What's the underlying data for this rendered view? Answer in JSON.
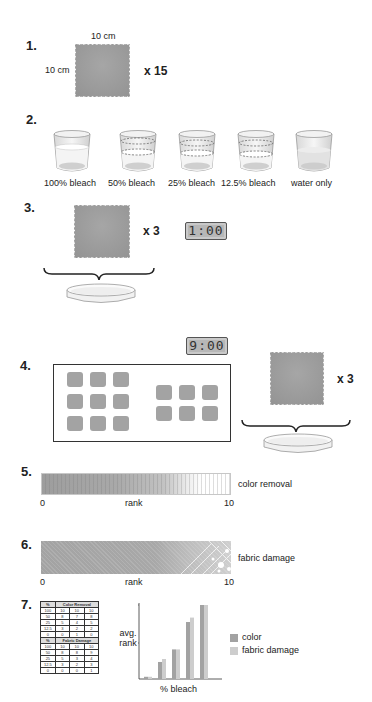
{
  "steps": {
    "s1": {
      "number": "1.",
      "width_label": "10 cm",
      "height_label": "10 cm",
      "multiplier": "x 15"
    },
    "s2": {
      "number": "2.",
      "cups": [
        {
          "label": "100% bleach",
          "fill": "full-bleach"
        },
        {
          "label": "50% bleach",
          "fill": "dashed-half"
        },
        {
          "label": "25% bleach",
          "fill": "dashed-quarter"
        },
        {
          "label": "12.5% bleach",
          "fill": "dashed-eighth"
        },
        {
          "label": "water only",
          "fill": "water"
        }
      ]
    },
    "s3": {
      "number": "3.",
      "multiplier": "x 3",
      "timer": "1:00"
    },
    "s4": {
      "number": "4.",
      "timer": "9:00",
      "multiplier": "x 3"
    },
    "s5": {
      "number": "5.",
      "scale_label": "color removal",
      "min": "0",
      "mid": "rank",
      "max": "10"
    },
    "s6": {
      "number": "6.",
      "scale_label": "fabric damage",
      "min": "0",
      "mid": "rank",
      "max": "10"
    },
    "s7": {
      "number": "7.",
      "table": {
        "pct_header": "%",
        "color_header": "Color Removal",
        "damage_header": "Fabric Damage",
        "color_rows": [
          [
            "100",
            "10",
            "10",
            "10"
          ],
          [
            "50",
            "8",
            "7",
            "8"
          ],
          [
            "25",
            "5",
            "4",
            "5"
          ],
          [
            "12.5",
            "3",
            "2",
            "2"
          ],
          [
            "0",
            "0",
            "1",
            "0"
          ]
        ],
        "damage_rows": [
          [
            "100",
            "10",
            "10",
            "10"
          ],
          [
            "50",
            "8",
            "8",
            "9"
          ],
          [
            "25",
            "5",
            "3",
            "4"
          ],
          [
            "12.5",
            "3",
            "2",
            "3"
          ],
          [
            "0",
            "0",
            "0",
            "1"
          ]
        ]
      },
      "legend": [
        {
          "label": "color",
          "color": "#a2a2a2"
        },
        {
          "label": "fabric damage",
          "color": "#cdcdcd"
        }
      ]
    }
  },
  "chart_data": {
    "type": "bar",
    "title": "",
    "xlabel": "% bleach",
    "ylabel": "avg. rank",
    "categories": [
      "0",
      "12.5",
      "25",
      "50",
      "100"
    ],
    "series": [
      {
        "name": "color",
        "values": [
          0.3,
          2.3,
          4.0,
          7.7,
          10
        ]
      },
      {
        "name": "fabric damage",
        "values": [
          0.3,
          2.7,
          4.0,
          8.3,
          10
        ]
      }
    ],
    "ylim": [
      0,
      10
    ],
    "grid": false,
    "legend_position": "right"
  }
}
